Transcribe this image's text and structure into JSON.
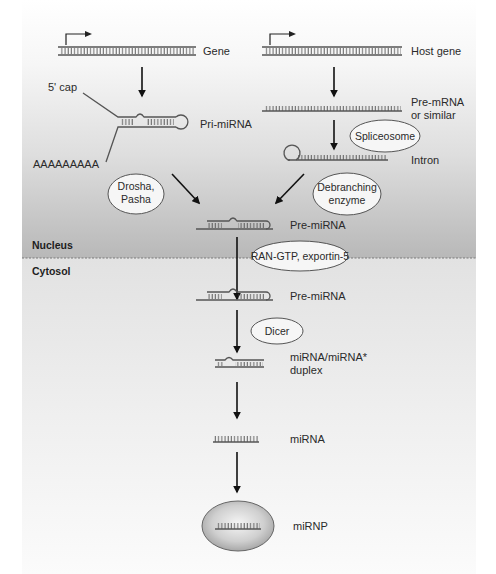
{
  "diagram": {
    "compartments": {
      "nucleus": "Nucleus",
      "cytosol": "Cytosol"
    },
    "left_branch": {
      "gene": "Gene",
      "five_cap": "5' cap",
      "pri_mirna": "Pri-miRNA",
      "polya": "AAAAAAAAA",
      "enzyme_line1": "Drosha,",
      "enzyme_line2": "Pasha"
    },
    "right_branch": {
      "host_gene": "Host gene",
      "pre_mrna_line1": "Pre-mRNA",
      "pre_mrna_line2": "or similar",
      "spliceosome": "Spliceosome",
      "intron": "Intron",
      "debranch_line1": "Debranching",
      "debranch_line2": "enzyme"
    },
    "main_path": {
      "pre_mirna_nucleus": "Pre-miRNA",
      "export": "RAN-GTP, exportin-5",
      "pre_mirna_cytosol": "Pre-miRNA",
      "dicer": "Dicer",
      "duplex_line1": "miRNA/miRNA*",
      "duplex_line2": "duplex",
      "mirna": "miRNA",
      "mirnp": "miRNP"
    },
    "colors": {
      "line": "#555555",
      "arrow": "#111111",
      "ellipse_fill": "#f4f4f4",
      "nucleus_bottom": "#b9b9b9",
      "cytosol_top": "#e0e0e0"
    }
  }
}
